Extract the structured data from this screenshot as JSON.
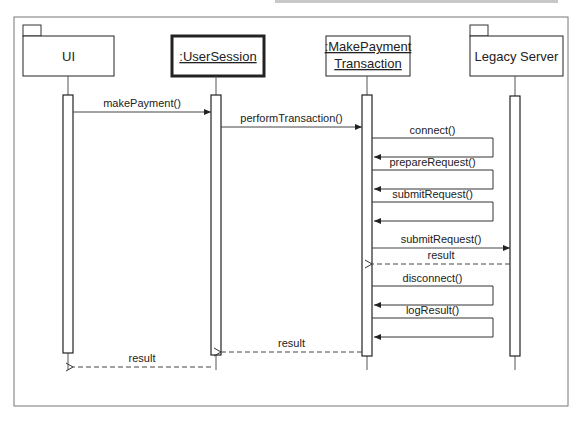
{
  "diagram": {
    "type": "sequence",
    "participants": [
      {
        "id": "ui",
        "label": [
          "UI"
        ],
        "kind": "package",
        "underline": false,
        "bold_border": false
      },
      {
        "id": "session",
        "label": [
          ":UserSession"
        ],
        "kind": "object",
        "underline": true,
        "bold_border": true
      },
      {
        "id": "txn",
        "label": [
          ":MakePayment",
          "Transaction"
        ],
        "kind": "object",
        "underline": true,
        "bold_border": false
      },
      {
        "id": "legacy",
        "label": [
          "Legacy Server"
        ],
        "kind": "package",
        "underline": false,
        "bold_border": false
      }
    ],
    "messages": [
      {
        "from": "ui",
        "to": "session",
        "label": "makePayment()",
        "style": "sync"
      },
      {
        "from": "session",
        "to": "txn",
        "label": "performTransaction()",
        "style": "sync"
      },
      {
        "from": "txn",
        "to": "txn",
        "label": "connect()",
        "style": "self"
      },
      {
        "from": "txn",
        "to": "txn",
        "label": "prepareRequest()",
        "style": "self"
      },
      {
        "from": "txn",
        "to": "txn",
        "label": "submitRequest()",
        "style": "self"
      },
      {
        "from": "txn",
        "to": "legacy",
        "label": "submitRequest()",
        "style": "sync"
      },
      {
        "from": "legacy",
        "to": "txn",
        "label": "result",
        "style": "return"
      },
      {
        "from": "txn",
        "to": "txn",
        "label": "disconnect()",
        "style": "self"
      },
      {
        "from": "txn",
        "to": "txn",
        "label": "logResult()",
        "style": "self"
      },
      {
        "from": "txn",
        "to": "session",
        "label": "result",
        "style": "return"
      },
      {
        "from": "session",
        "to": "ui",
        "label": "result",
        "style": "return"
      }
    ]
  }
}
